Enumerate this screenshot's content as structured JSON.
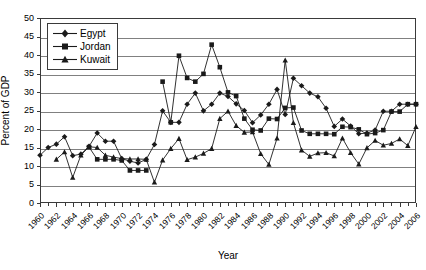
{
  "chart_data": {
    "type": "line",
    "title": "",
    "xlabel": "Year",
    "ylabel": "Percent of GDP",
    "ylim": [
      0,
      50
    ],
    "ytick_step": 5,
    "yticks": [
      0,
      5,
      10,
      15,
      20,
      25,
      30,
      35,
      40,
      45,
      50
    ],
    "xlim": [
      1960,
      2006
    ],
    "xtick_step": 2,
    "x": [
      1960,
      1961,
      1962,
      1963,
      1964,
      1965,
      1966,
      1967,
      1968,
      1969,
      1970,
      1971,
      1972,
      1973,
      1974,
      1975,
      1976,
      1977,
      1978,
      1979,
      1980,
      1981,
      1982,
      1983,
      1984,
      1985,
      1986,
      1987,
      1988,
      1989,
      1990,
      1991,
      1992,
      1993,
      1994,
      1995,
      1996,
      1997,
      1998,
      1999,
      2000,
      2001,
      2002,
      2003,
      2004,
      2005,
      2006
    ],
    "xtick_labels": [
      "1960",
      "1962",
      "1964",
      "1966",
      "1968",
      "1970",
      "1972",
      "1974",
      "1976",
      "1978",
      "1980",
      "1982",
      "1984",
      "1986",
      "1988",
      "1990",
      "1992",
      "1994",
      "1996",
      "1998",
      "2000",
      "2002",
      "2004",
      "2006"
    ],
    "grid": "horizontal",
    "legend_position": "top-left-inside",
    "series": [
      {
        "name": "Egypt",
        "marker": "diamond",
        "values": [
          12.9,
          15.0,
          15.9,
          17.9,
          12.8,
          13.2,
          15.3,
          18.9,
          16.7,
          16.7,
          12.0,
          11.3,
          10.8,
          11.8,
          15.8,
          24.9,
          21.8,
          21.8,
          26.7,
          29.7,
          24.9,
          26.7,
          29.7,
          28.8,
          26.8,
          25.0,
          21.7,
          23.8,
          26.7,
          30.7,
          23.9,
          33.7,
          31.7,
          29.7,
          28.7,
          25.6,
          20.7,
          22.7,
          20.8,
          18.7,
          18.9,
          19.7,
          24.8,
          24.8,
          26.7,
          26.7,
          26.7
        ]
      },
      {
        "name": "Jordan",
        "marker": "square",
        "values": [
          null,
          null,
          null,
          null,
          null,
          null,
          15.1,
          11.8,
          11.8,
          11.8,
          11.5,
          8.8,
          8.8,
          8.8,
          null,
          32.8,
          21.8,
          39.8,
          33.8,
          32.8,
          34.9,
          42.8,
          36.7,
          29.9,
          28.9,
          22.8,
          19.8,
          19.6,
          22.8,
          22.7,
          25.7,
          25.8,
          19.6,
          18.7,
          18.7,
          18.7,
          18.6,
          20.6,
          20.5,
          19.9,
          18.6,
          18.9,
          19.7,
          24.7,
          24.7,
          26.7,
          26.7
        ]
      },
      {
        "name": "Kuwait",
        "marker": "triangle",
        "values": [
          null,
          null,
          11.8,
          13.8,
          6.9,
          12.9,
          15.2,
          15.0,
          12.9,
          12.4,
          12.0,
          11.9,
          11.9,
          11.8,
          5.6,
          11.6,
          14.7,
          17.4,
          11.7,
          12.4,
          13.4,
          14.7,
          22.8,
          24.8,
          20.9,
          19.1,
          19.2,
          13.3,
          10.4,
          17.5,
          38.6,
          21.7,
          14.3,
          12.6,
          13.5,
          13.6,
          12.7,
          17.5,
          13.6,
          10.5,
          14.9,
          16.9,
          15.6,
          16.1,
          17.3,
          15.5,
          20.6
        ]
      }
    ]
  },
  "legend": {
    "items": [
      {
        "label": "Egypt"
      },
      {
        "label": "Jordan"
      },
      {
        "label": "Kuwait"
      }
    ]
  },
  "colors": {
    "series_line": "#1a1a1a",
    "gridline": "#808080",
    "axis": "#3a3a3a",
    "background": "#ffffff",
    "text": "#000000"
  }
}
